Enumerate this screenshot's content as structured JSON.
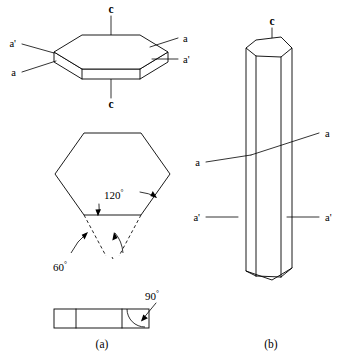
{
  "figure": {
    "background_color": "#ffffff",
    "line_color": "#000000",
    "panels": [
      {
        "id": "a",
        "caption": "(a)",
        "description": "tabular hexagonal plate, basal hexagon with angles, and thin edge-on slab"
      },
      {
        "id": "b",
        "caption": "(b)",
        "description": "elongate hexagonal prism"
      }
    ]
  },
  "panel_a": {
    "caption": "(a)",
    "plate": {
      "name": "hexagonal-plate",
      "axis_top_label": "c",
      "axis_bottom_label": "c",
      "labels": {
        "left_upper": "a'",
        "left_lower": "a",
        "right_upper": "a",
        "right_lower": "a'"
      }
    },
    "basal_hexagon": {
      "name": "basal-hexagon",
      "interior_angle": "120",
      "interior_angle_unit": "°",
      "exterior_angle": "60",
      "exterior_angle_unit": "°"
    },
    "edge_slab": {
      "name": "edge-on-slab",
      "angle": "90",
      "angle_unit": "°",
      "segments": 3
    }
  },
  "panel_b": {
    "caption": "(b)",
    "prism": {
      "name": "hexagonal-prism",
      "axis_top_label": "c",
      "labels": {
        "left_upper": "a",
        "left_lower": "a'",
        "right_upper": "a",
        "right_lower": "a'"
      }
    }
  }
}
